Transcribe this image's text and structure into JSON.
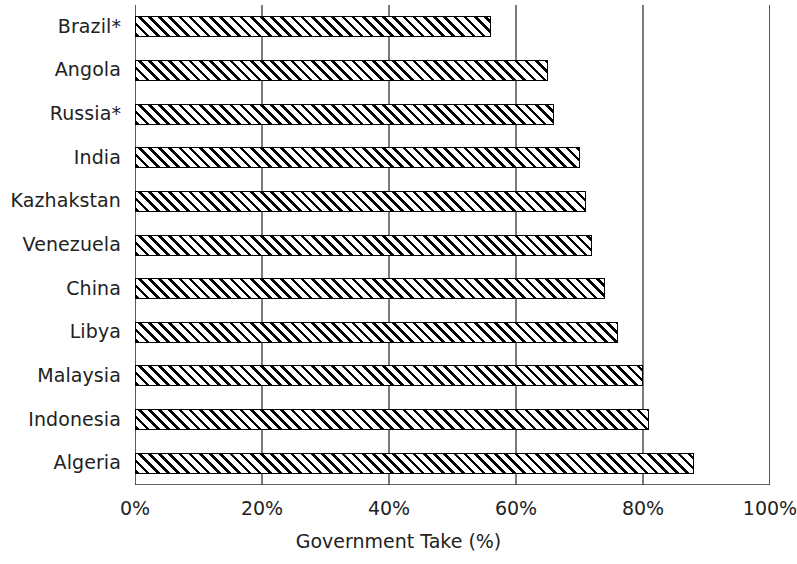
{
  "chart_data": {
    "type": "bar",
    "orientation": "horizontal",
    "title": "",
    "xlabel": "Government Take (%)",
    "ylabel": "",
    "categories": [
      "Brazil*",
      "Angola",
      "Russia*",
      "India",
      "Kazhakstan",
      "Venezuela",
      "China",
      "Libya",
      "Malaysia",
      "Indonesia",
      "Algeria"
    ],
    "values": [
      56,
      65,
      66,
      70,
      71,
      72,
      74,
      76,
      80,
      81,
      88
    ],
    "xlim": [
      0,
      100
    ],
    "xticks": [
      0,
      20,
      40,
      60,
      80,
      100
    ],
    "xtick_labels": [
      "0%",
      "20%",
      "40%",
      "60%",
      "80%",
      "100%"
    ],
    "grid": "vertical",
    "legend": null,
    "bar_style": {
      "fill": "diagonal-hatch",
      "hatch_color": "#000000",
      "background": "#ffffff",
      "border": "#000000"
    }
  }
}
